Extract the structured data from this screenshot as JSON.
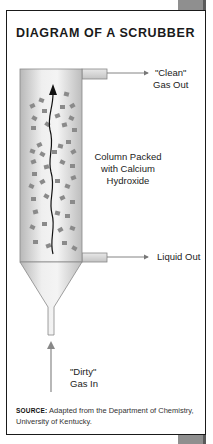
{
  "figure": {
    "title": "DIAGRAM OF A SCRUBBER",
    "labels": {
      "clean_gas_out_line1": "\"Clean\"",
      "clean_gas_out_line2": "Gas Out",
      "column_line1": "Column Packed",
      "column_line2": "with Calcium",
      "column_line3": "Hydroxide",
      "liquid_out": "Liquid Out",
      "dirty_gas_in_line1": "\"Dirty\"",
      "dirty_gas_in_line2": "Gas In"
    },
    "source": {
      "prefix": "SOURCE:",
      "text": "Adapted from the Department of Chemistry, University of Kentucky."
    }
  },
  "colors": {
    "frame_border": "#1a1a1a",
    "corner_tab": "#8f8f8f",
    "column_fill": "#d8d8d8",
    "packing": "#8a8a8a",
    "arrow_gray": "#888888"
  }
}
